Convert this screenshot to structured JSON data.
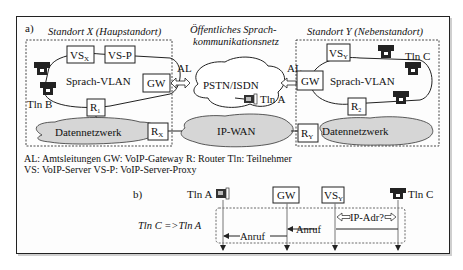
{
  "figure": {
    "part_a_label": "a)",
    "part_b_label": "b)",
    "site_x": {
      "title": "Standort X (Haupstandort)",
      "vlan_label": "Sprach-VLAN",
      "vs_label": "VS",
      "vs_sub": "X",
      "vsp_label": "VS-P",
      "gw_label": "GW",
      "router_label": "R",
      "router_sub": "1",
      "edge_router_label": "R",
      "edge_router_sub": "X",
      "data_network": "Datennetzwerk",
      "subscriber": "Tln B"
    },
    "site_y": {
      "title": "Standort Y (Nebenstandort)",
      "vlan_label": "Sprach-VLAN",
      "vs_label": "VS",
      "vs_sub": "Y",
      "gw_label": "GW",
      "router_label": "R",
      "router_sub": "2",
      "edge_router_label": "R",
      "edge_router_sub": "Y",
      "data_network": "Datennetzwerk",
      "subscriber": "Tln C"
    },
    "public_network": {
      "title_line1": "Öffentliches Sprach-",
      "title_line2": "kommunikationsnetz",
      "label": "PSTN/ISDN",
      "subscriber": "Tln A",
      "trunk_left": "AL",
      "trunk_right": "AL"
    },
    "ip_wan": "IP-WAN",
    "legend": {
      "line1": "AL: Amtsleitungen   GW: VoIP-Gateway   R: Router   Tln: Teilnehmer",
      "line2": "VS: VoIP-Server   VS-P: VoIP-Server-Proxy"
    },
    "sequence": {
      "scenario": "Tln C =>Tln A",
      "participants": [
        "Tln A",
        "GW",
        "VS",
        "Tln C"
      ],
      "vs_sub": "Y",
      "messages": [
        {
          "label": "IP-Adr?",
          "from": "Tln C",
          "to": "VS",
          "bidirectional": true
        },
        {
          "label": "Anruf",
          "from": "Tln C",
          "to": "GW"
        },
        {
          "label": "Anruf",
          "from": "GW",
          "to": "Tln A"
        }
      ]
    }
  }
}
